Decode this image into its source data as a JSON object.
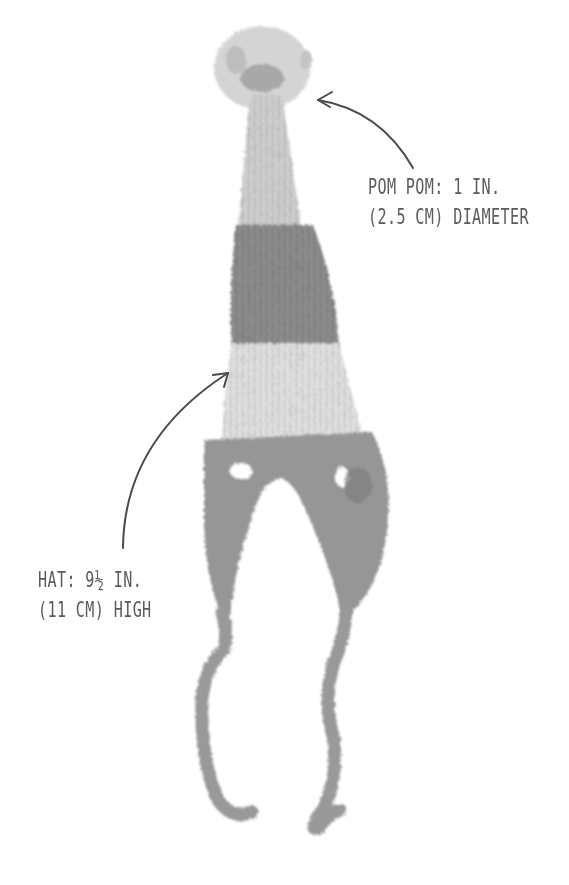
{
  "figure": {
    "colors": {
      "background": "#ffffff",
      "pom_pom": "#d2d2d2",
      "light_yarn": "#dcdcdc",
      "dark_yarn": "#8e8e8e",
      "earflap_yarn": "#969696",
      "annotation": "#555555"
    }
  },
  "annotations": {
    "pom_pom": {
      "line1": "POM POM: 1 IN.",
      "line2": "(2.5 CM) DIAMETER"
    },
    "hat": {
      "line1": "HAT: 9½ IN.",
      "line2": "(11 CM) HIGH"
    }
  }
}
